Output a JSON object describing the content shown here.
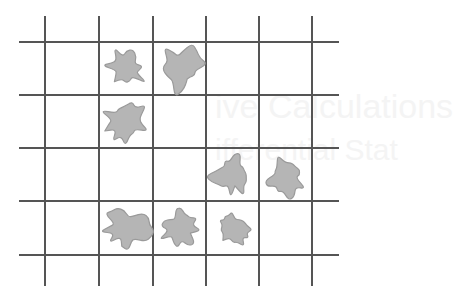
{
  "diagram": {
    "type": "grid-occupancy",
    "grid": {
      "columns": 5,
      "rows": 4
    },
    "colors": {
      "line": "#555555",
      "blob_fill": "#b5b5b5",
      "blob_edge": "#9a9a9a",
      "background": "#ffffff"
    },
    "occupied_cells": [
      {
        "row": 0,
        "col": 1,
        "shape": 0
      },
      {
        "row": 0,
        "col": 2,
        "shape": 1
      },
      {
        "row": 1,
        "col": 1,
        "shape": 2
      },
      {
        "row": 2,
        "col": 3,
        "shape": 3
      },
      {
        "row": 2,
        "col": 4,
        "shape": 4
      },
      {
        "row": 3,
        "col": 1,
        "shape": 5
      },
      {
        "row": 3,
        "col": 2,
        "shape": 6
      },
      {
        "row": 3,
        "col": 3,
        "shape": 7
      }
    ],
    "bleed_through_text": [
      "ive Calculations",
      "ifferential Stat"
    ]
  }
}
